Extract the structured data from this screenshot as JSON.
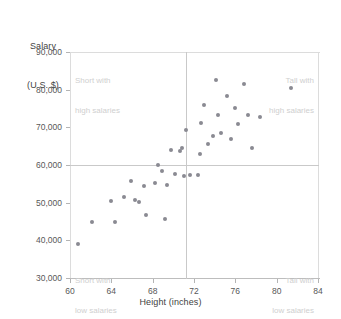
{
  "chart_data": {
    "type": "scatter",
    "title": "",
    "ylabel": "Salary\n(U.S. $)",
    "ylabel_line1": "Salary",
    "ylabel_line2": "(U.S. $)",
    "xlabel": "Height (inches)",
    "xlim": [
      60,
      84
    ],
    "ylim": [
      30000,
      90000
    ],
    "x_ticks": [
      60,
      64,
      68,
      72,
      76,
      80,
      84
    ],
    "x_tick_labels": [
      "60",
      "64",
      "68",
      "72",
      "76",
      "80",
      "84"
    ],
    "y_ticks": [
      30000,
      40000,
      50000,
      60000,
      70000,
      80000,
      90000
    ],
    "y_tick_labels": [
      "30,000",
      "40,000",
      "50,000",
      "60,000",
      "70,000",
      "80,000",
      "90,000"
    ],
    "grid": false,
    "legend": null,
    "reference_lines": {
      "vertical_x": 72,
      "horizontal_y": 60000
    },
    "annotations": [
      {
        "id": "top-left",
        "text": "Short with\nhigh salaries",
        "line1": "Short with",
        "line2": "high salaries"
      },
      {
        "id": "top-right",
        "text": "Tall with\nhigh salaries",
        "line1": "Tall with",
        "line2": "high salaries"
      },
      {
        "id": "bottom-left",
        "text": "Short with\nlow salaries",
        "line1": "Short with",
        "line2": "low salaries"
      },
      {
        "id": "bottom-right",
        "text": "Tall with\nlow salaries",
        "line1": "Tall with",
        "line2": "low salaries"
      }
    ],
    "point_color": "#8a8a92",
    "points": [
      {
        "x": 60.8,
        "y": 39000
      },
      {
        "x": 62.1,
        "y": 45000
      },
      {
        "x": 64.0,
        "y": 50500
      },
      {
        "x": 64.4,
        "y": 44800
      },
      {
        "x": 65.2,
        "y": 51400
      },
      {
        "x": 65.9,
        "y": 55700
      },
      {
        "x": 66.3,
        "y": 50600
      },
      {
        "x": 66.7,
        "y": 50200
      },
      {
        "x": 67.2,
        "y": 54500
      },
      {
        "x": 67.4,
        "y": 46800
      },
      {
        "x": 68.2,
        "y": 55300
      },
      {
        "x": 68.5,
        "y": 59900
      },
      {
        "x": 68.9,
        "y": 58500
      },
      {
        "x": 69.2,
        "y": 45600
      },
      {
        "x": 69.4,
        "y": 54700
      },
      {
        "x": 69.8,
        "y": 64000
      },
      {
        "x": 70.2,
        "y": 57500
      },
      {
        "x": 70.6,
        "y": 63800
      },
      {
        "x": 70.8,
        "y": 64600
      },
      {
        "x": 71.0,
        "y": 57200
      },
      {
        "x": 71.2,
        "y": 69300
      },
      {
        "x": 71.6,
        "y": 57400
      },
      {
        "x": 72.4,
        "y": 57400
      },
      {
        "x": 72.6,
        "y": 62800
      },
      {
        "x": 72.7,
        "y": 71200
      },
      {
        "x": 73.0,
        "y": 76000
      },
      {
        "x": 73.4,
        "y": 65600
      },
      {
        "x": 73.8,
        "y": 67600
      },
      {
        "x": 74.1,
        "y": 82600
      },
      {
        "x": 74.3,
        "y": 73400
      },
      {
        "x": 74.6,
        "y": 68400
      },
      {
        "x": 75.2,
        "y": 78200
      },
      {
        "x": 75.6,
        "y": 66800
      },
      {
        "x": 76.0,
        "y": 75200
      },
      {
        "x": 76.3,
        "y": 71000
      },
      {
        "x": 76.8,
        "y": 81400
      },
      {
        "x": 77.2,
        "y": 73200
      },
      {
        "x": 77.6,
        "y": 64400
      },
      {
        "x": 78.4,
        "y": 72800
      },
      {
        "x": 81.4,
        "y": 80400
      }
    ]
  }
}
